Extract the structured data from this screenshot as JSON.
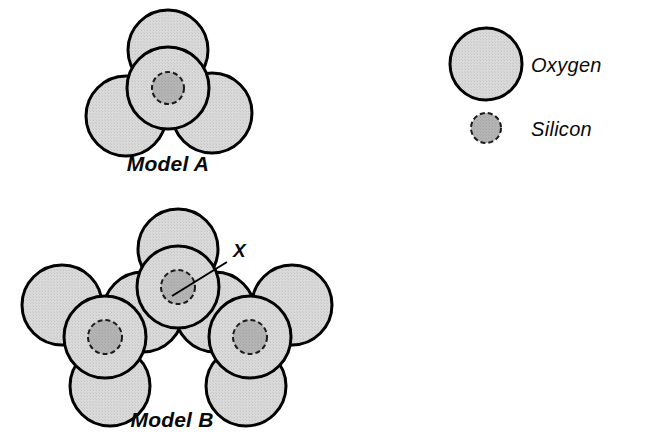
{
  "figure": {
    "background_color": "#ffffff",
    "width": 655,
    "height": 446,
    "type": "molecular-structure-diagram"
  },
  "style": {
    "oxygen_fill": "#d6d6d6",
    "oxygen_stroke": "#000000",
    "oxygen_stroke_width": 3,
    "oxygen_outline_style": "solid",
    "silicon_fill": "#b2b2b2",
    "silicon_stroke": "#1a1a1a",
    "silicon_stroke_width": 2,
    "silicon_outline_style": "dashed",
    "text_color": "#0a0a0a",
    "leader_line_color": "#000000"
  },
  "legend": {
    "name": "atom-key",
    "items": [
      {
        "label": "Oxygen",
        "symbol": "large-circle",
        "radius": 36,
        "outline": "solid",
        "fill": "#d6d6d6",
        "marker_cx": 486,
        "marker_cy": 64,
        "label_x": 531,
        "label_y": 72
      },
      {
        "label": "Silicon",
        "symbol": "small-circle",
        "radius": 15,
        "outline": "dashed",
        "fill": "#b2b2b2",
        "marker_cx": 486,
        "marker_cy": 128,
        "label_x": 531,
        "label_y": 136
      }
    ]
  },
  "models": [
    {
      "id": "model-a",
      "label": "Model A",
      "label_x": 168,
      "label_y": 171,
      "description": "single silicate tetrahedron, one silicon surrounded by oxygens",
      "silicon_count": 1,
      "oxygen_count": 4,
      "outer_oxygens": [
        {
          "cx": 168,
          "cy": 50,
          "r": 40,
          "position": "top"
        },
        {
          "cx": 126,
          "cy": 116,
          "r": 40,
          "position": "lower-left"
        },
        {
          "cx": 212,
          "cy": 113,
          "r": 40,
          "position": "lower-right"
        }
      ],
      "center_oxygens": [
        {
          "cx": 168,
          "cy": 88,
          "r": 41,
          "position": "center-front"
        }
      ],
      "silicons": [
        {
          "cx": 168,
          "cy": 88,
          "r": 16,
          "label": null
        }
      ]
    },
    {
      "id": "model-b",
      "label": "Model B",
      "label_x": 172,
      "label_y": 427,
      "description": "three linked silicate tetrahedra sharing bridging oxygens",
      "silicon_count": 3,
      "oxygen_count": 10,
      "outer_oxygens": [
        {
          "cx": 178,
          "cy": 249,
          "r": 40,
          "position": "top-center"
        },
        {
          "cx": 62,
          "cy": 305,
          "r": 40,
          "position": "upper-left"
        },
        {
          "cx": 110,
          "cy": 386,
          "r": 40,
          "position": "bottom-left"
        },
        {
          "cx": 292,
          "cy": 305,
          "r": 40,
          "position": "upper-right"
        },
        {
          "cx": 246,
          "cy": 386,
          "r": 40,
          "position": "bottom-right"
        },
        {
          "cx": 143,
          "cy": 312,
          "r": 40,
          "position": "bridge-left"
        },
        {
          "cx": 215,
          "cy": 312,
          "r": 40,
          "position": "bridge-right"
        }
      ],
      "center_oxygens": [
        {
          "cx": 178,
          "cy": 287,
          "r": 41,
          "position": "center-front"
        },
        {
          "cx": 105,
          "cy": 337,
          "r": 41,
          "position": "left-front"
        },
        {
          "cx": 250,
          "cy": 337,
          "r": 41,
          "position": "right-front"
        }
      ],
      "silicons": [
        {
          "cx": 178,
          "cy": 287,
          "r": 17,
          "label": "X"
        },
        {
          "cx": 105,
          "cy": 337,
          "r": 17,
          "label": null
        },
        {
          "cx": 250,
          "cy": 337,
          "r": 17,
          "label": null
        }
      ],
      "annotations": [
        {
          "text": "X",
          "text_x": 233,
          "text_y": 257,
          "leader_from_x": 227,
          "leader_from_y": 262,
          "leader_to_x": 172,
          "leader_to_y": 296,
          "points_at": "central silicon atom"
        }
      ]
    }
  ]
}
